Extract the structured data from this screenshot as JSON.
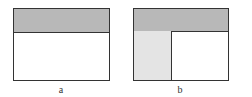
{
  "figures": [
    {
      "label": "a",
      "description": "Layout with header region",
      "regions": [
        "header",
        "content"
      ],
      "colors": {
        "header": "#b8b8b8",
        "content": "#ffffff",
        "border": "#333333"
      }
    },
    {
      "label": "b",
      "description": "Layout with header region and left sidebar",
      "regions": [
        "header",
        "sidebar",
        "content"
      ],
      "colors": {
        "header": "#b8b8b8",
        "sidebar": "#e4e4e4",
        "content": "#ffffff",
        "border": "#333333"
      }
    }
  ]
}
